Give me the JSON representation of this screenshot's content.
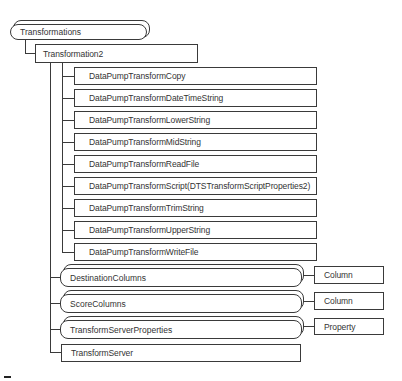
{
  "diagram": {
    "root": {
      "label": "Transformations",
      "kind": "collection"
    },
    "object": {
      "label": "Transformation2",
      "kind": "object"
    },
    "transforms": [
      {
        "label": "DataPumpTransformCopy"
      },
      {
        "label": "DataPumpTransformDateTimeString"
      },
      {
        "label": "DataPumpTransformLowerString"
      },
      {
        "label": "DataPumpTransformMidString"
      },
      {
        "label": "DataPumpTransformReadFile"
      },
      {
        "label": "DataPumpTransformScript(DTSTransformScriptProperties2)"
      },
      {
        "label": "DataPumpTransformTrimString"
      },
      {
        "label": "DataPumpTransformUpperString"
      },
      {
        "label": "DataPumpTransformWriteFile"
      }
    ],
    "collections": [
      {
        "label": "DestinationColumns",
        "child": "Column"
      },
      {
        "label": "ScoreColumns",
        "child": "Column"
      },
      {
        "label": "TransformServerProperties",
        "child": "Property"
      }
    ],
    "server": {
      "label": "TransformServer",
      "kind": "object"
    }
  }
}
